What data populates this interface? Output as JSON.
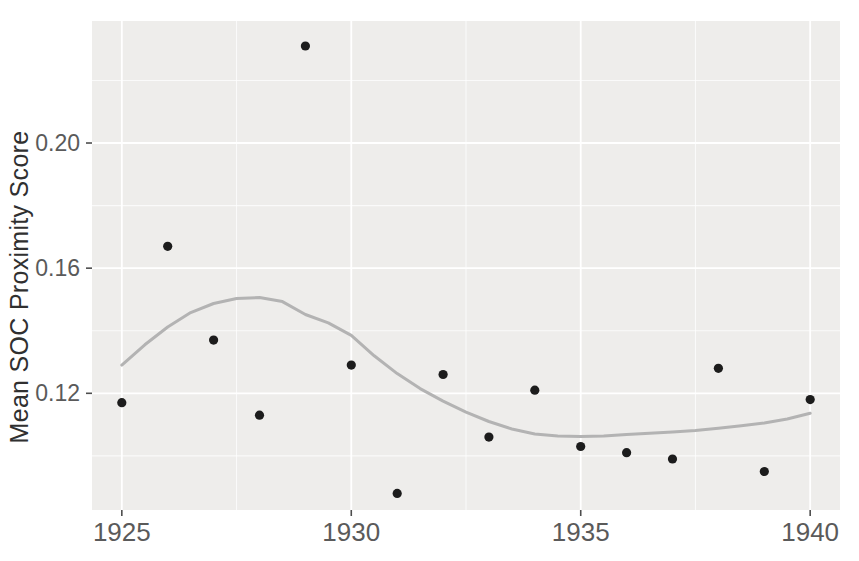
{
  "chart_data": {
    "type": "scatter",
    "title": "",
    "xlabel": "",
    "ylabel": "Mean SOC Proximity Score",
    "legend": "none",
    "grid": "major and minor white gridlines on gray panel",
    "xlim": [
      1924.35,
      1940.65
    ],
    "ylim": [
      0.0827,
      0.239
    ],
    "x_ticks": [
      {
        "value": 1925,
        "label": "1925"
      },
      {
        "value": 1930,
        "label": "1930"
      },
      {
        "value": 1935,
        "label": "1935"
      },
      {
        "value": 1940,
        "label": "1940"
      }
    ],
    "y_ticks": [
      {
        "value": 0.12,
        "label": "0.12"
      },
      {
        "value": 0.16,
        "label": "0.16"
      },
      {
        "value": 0.2,
        "label": "0.20"
      }
    ],
    "x_minor_ticks": [
      1927.5,
      1932.5,
      1937.5
    ],
    "y_minor_ticks": [
      0.1,
      0.14,
      0.18,
      0.22
    ],
    "series": [
      {
        "name": "mean-soc-proximity-points",
        "type": "scatter",
        "x": [
          1925,
          1926,
          1927,
          1928,
          1929,
          1930,
          1931,
          1932,
          1933,
          1934,
          1935,
          1936,
          1937,
          1938,
          1939,
          1940
        ],
        "y": [
          0.117,
          0.167,
          0.137,
          0.113,
          0.231,
          0.129,
          0.088,
          0.126,
          0.106,
          0.121,
          0.103,
          0.101,
          0.099,
          0.128,
          0.095,
          0.118
        ]
      },
      {
        "name": "loess-smooth-trend",
        "type": "line",
        "x": [
          1925,
          1925.5,
          1926,
          1926.5,
          1927,
          1927.5,
          1928,
          1928.5,
          1929,
          1929.5,
          1930,
          1930.5,
          1931,
          1931.5,
          1932,
          1932.5,
          1933,
          1933.5,
          1934,
          1934.5,
          1935,
          1935.5,
          1936,
          1936.5,
          1937,
          1937.5,
          1938,
          1938.5,
          1939,
          1939.5,
          1940
        ],
        "y": [
          0.129,
          0.1355,
          0.1412,
          0.1458,
          0.1487,
          0.1503,
          0.1506,
          0.1493,
          0.1452,
          0.1425,
          0.1385,
          0.132,
          0.1263,
          0.1215,
          0.1175,
          0.114,
          0.111,
          0.1086,
          0.107,
          0.1064,
          0.1062,
          0.1064,
          0.1068,
          0.1072,
          0.1076,
          0.1081,
          0.1088,
          0.1096,
          0.1105,
          0.1118,
          0.1136
        ]
      }
    ],
    "colors": {
      "point": "#1c1c1c",
      "smooth_line": "#b3b3b3",
      "panel_bg": "#eeedeb",
      "grid_major": "#ffffff",
      "grid_minor": "#ffffff",
      "tick_label": "#5a5a5a",
      "axis_title": "#303030",
      "tick_mark": "#4d4d4d",
      "page_bg": "#ffffff"
    }
  }
}
